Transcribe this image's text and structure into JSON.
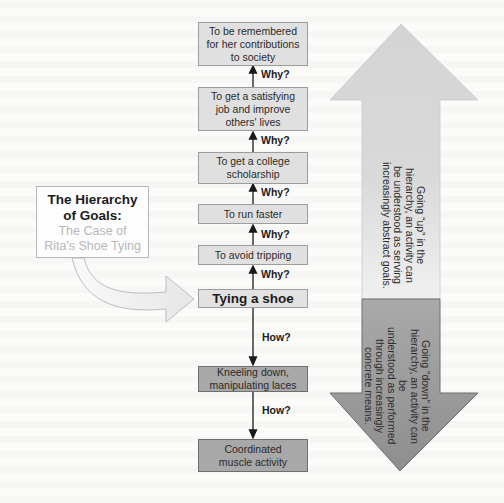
{
  "title": {
    "main": "The Hierarchy of Goals:",
    "main_line1": "The Hierarchy",
    "main_line2": "of Goals:",
    "sub_line1": "The Case of",
    "sub_line2": "Rita's Shoe Tying"
  },
  "hierarchy": [
    {
      "label": "To be remembered for her contributions to society",
      "lines": [
        "To be remembered",
        "for her contributions",
        "to society"
      ],
      "level": "abstract"
    },
    {
      "label": "To get a satisfying job and improve others' lives",
      "lines": [
        "To get a satisfying",
        "job and improve",
        "others' lives"
      ],
      "level": "abstract"
    },
    {
      "label": "To get a college scholarship",
      "lines": [
        "To get a college",
        "scholarship"
      ],
      "level": "abstract"
    },
    {
      "label": "To run faster",
      "lines": [
        "To run faster"
      ],
      "level": "abstract"
    },
    {
      "label": "To avoid tripping",
      "lines": [
        "To avoid tripping"
      ],
      "level": "abstract"
    },
    {
      "label": "Tying a shoe",
      "lines": [
        "Tying a shoe"
      ],
      "level": "focus"
    },
    {
      "label": "Kneeling down, manipulating laces",
      "lines": [
        "Kneeling down,",
        "manipulating laces"
      ],
      "level": "concrete"
    },
    {
      "label": "Coordinated muscle activity",
      "lines": [
        "Coordinated",
        "muscle activity"
      ],
      "level": "concrete"
    }
  ],
  "connectors": {
    "why_label": "Why?",
    "how_label": "How?",
    "why_count": 5,
    "how_count": 2
  },
  "side_arrows": {
    "up": {
      "lines": [
        "Going “up” in the",
        "hierarchy, an activity can",
        "be understood as serving",
        "increasingly abstract goals."
      ],
      "color": "#d6d6d6"
    },
    "down": {
      "lines": [
        "Going “down” in the",
        "hierarchy, an activity can be",
        "understood as performed",
        "through increasingly",
        "concrete means."
      ],
      "color": "#9a9a9a"
    }
  },
  "colors": {
    "box_light": "#e0e0e0",
    "box_dark": "#a8a8a8",
    "title_sub": "#b8b8b8"
  }
}
